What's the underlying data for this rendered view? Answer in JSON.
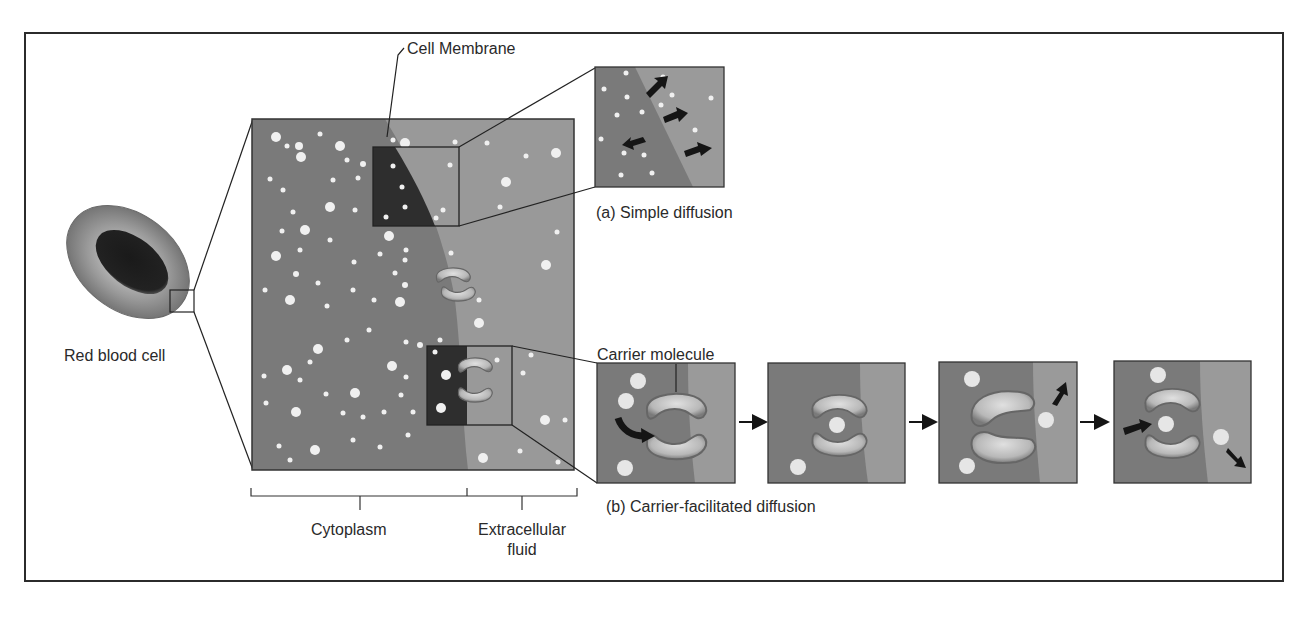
{
  "colors": {
    "frame": "#2b2b2b",
    "cytoplasm": "#7a7a7a",
    "extracellular": "#9a9a9a",
    "zoom_dark": "#3a3a3a",
    "particle": "#f2f2f2",
    "carrier_fill": "#bdbdbd",
    "carrier_edge": "#6a6a6a",
    "arrow": "#151515",
    "rbc_outer": "#8c8c8c",
    "rbc_inner": "#202020"
  },
  "labels": {
    "red_blood_cell": "Red blood cell",
    "cell_membrane": "Cell Membrane",
    "simple_diffusion": "(a) Simple diffusion",
    "carrier_molecule": "Carrier molecule",
    "carrier_facilitated": "(b) Carrier-facilitated diffusion",
    "cytoplasm": "Cytoplasm",
    "extracellular_line1": "Extracellular",
    "extracellular_line2": "fluid"
  },
  "panels": {
    "simple_diffusion_panel": {
      "arrows": 4
    },
    "carrier_steps": [
      {
        "step": 1,
        "description": "particle binding to carrier"
      },
      {
        "step": 2,
        "description": "particle inside carrier"
      },
      {
        "step": 3,
        "description": "carrier opens to extracellular side, particle released"
      },
      {
        "step": 4,
        "description": "next particle enters, previous exits"
      }
    ]
  }
}
